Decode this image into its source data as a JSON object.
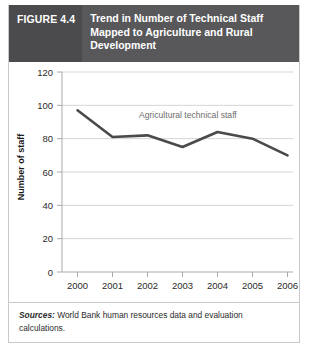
{
  "figure": {
    "number_label": "FIGURE 4.4",
    "title": "Trend in Number of Technical Staff Mapped to Agriculture and Rural Development"
  },
  "source": {
    "label": "Sources:",
    "text": " World Bank human resources data and evaluation calculations."
  },
  "chart_data": {
    "type": "line",
    "title": "",
    "xlabel": "",
    "ylabel": "Number of staff",
    "categories": [
      "2000",
      "2001",
      "2002",
      "2003",
      "2004",
      "2005",
      "2006"
    ],
    "series": [
      {
        "name": "Agricultural technical staff",
        "values": [
          97,
          81,
          82,
          75,
          84,
          80,
          70
        ]
      }
    ],
    "annotations": [
      "Agricultural technical staff"
    ],
    "ylim": [
      0,
      120
    ],
    "yticks": [
      "0",
      "20",
      "40",
      "60",
      "80",
      "100",
      "120"
    ],
    "grid": true,
    "legend": "none",
    "line_color": "#4a4a4a",
    "grid_color": "#d5d5d5"
  }
}
